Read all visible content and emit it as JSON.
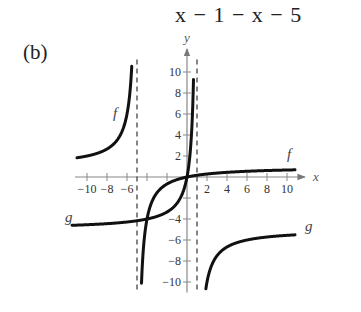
{
  "header": {
    "expression": "x − 1 − x − 5"
  },
  "part_label": "(b)",
  "chart_data": {
    "type": "line",
    "title": "",
    "xlabel": "x",
    "ylabel": "y",
    "xlim": [
      -11,
      11
    ],
    "ylim": [
      -11,
      11
    ],
    "grid": false,
    "x_ticks": [
      -10,
      -8,
      -6,
      2,
      4,
      6,
      8,
      10
    ],
    "x_tick_labels": [
      "−10",
      "−8",
      "−6",
      "2",
      "4",
      "6",
      "8",
      "10"
    ],
    "y_ticks": [
      10,
      8,
      6,
      4,
      2,
      -4,
      -6,
      -8,
      -10
    ],
    "y_tick_labels": [
      "10",
      "8",
      "6",
      "4",
      "2",
      "−4",
      "−6",
      "−8",
      "−10"
    ],
    "asymptotes": [
      {
        "type": "vertical",
        "x": -5,
        "style": "dashed"
      },
      {
        "type": "vertical",
        "x": 1,
        "style": "dashed"
      }
    ],
    "series": [
      {
        "name": "f",
        "description": "rational function with vertical asymptote x = -5, horizontal asymptote y = 1, passes through origin",
        "points_left_branch": [
          [
            -11,
            1.83
          ],
          [
            -10,
            2
          ],
          [
            -8,
            2.67
          ],
          [
            -7,
            3.5
          ],
          [
            -6,
            6
          ],
          [
            -5.5,
            11
          ]
        ],
        "points_right_branch": [
          [
            -4.55,
            -10.1
          ],
          [
            -4,
            -4
          ],
          [
            -3,
            -1.5
          ],
          [
            -2,
            -0.67
          ],
          [
            0,
            0
          ],
          [
            2,
            0.29
          ],
          [
            4,
            0.44
          ],
          [
            6,
            0.55
          ],
          [
            8,
            0.62
          ],
          [
            10,
            0.67
          ]
        ]
      },
      {
        "name": "g",
        "description": "rational function with vertical asymptote x = 1, horizontal asymptote y = -5, passes through origin",
        "points_left_branch": [
          [
            -10,
            -4.55
          ],
          [
            -8,
            -4.44
          ],
          [
            -6,
            -4.29
          ],
          [
            -4,
            -4
          ],
          [
            -2,
            -3.33
          ],
          [
            -1,
            -2.5
          ],
          [
            0,
            0
          ],
          [
            0.5,
            5
          ],
          [
            0.67,
            10.1
          ]
        ],
        "points_right_branch": [
          [
            1.45,
            -11
          ],
          [
            2,
            -10
          ],
          [
            3,
            -7.5
          ],
          [
            4,
            -6.67
          ],
          [
            6,
            -6
          ],
          [
            8,
            -5.71
          ],
          [
            10,
            -5.56
          ]
        ]
      }
    ],
    "curve_labels": [
      {
        "text": "f",
        "near": [
          -7,
          6
        ]
      },
      {
        "text": "f",
        "near": [
          10,
          1.5
        ]
      },
      {
        "text": "g",
        "near": [
          -11.5,
          -4.6
        ]
      },
      {
        "text": "g",
        "near": [
          11.5,
          -5.5
        ]
      }
    ]
  }
}
